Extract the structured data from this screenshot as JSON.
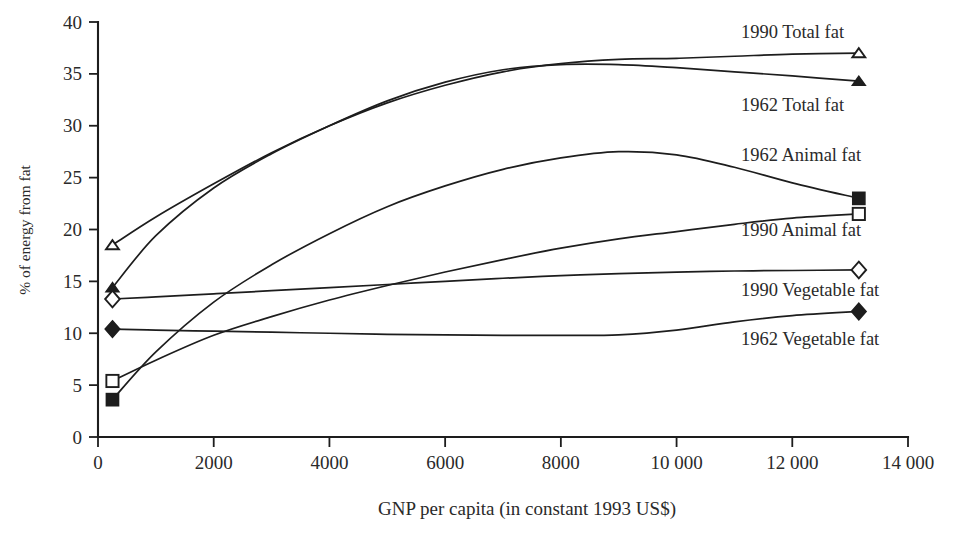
{
  "chart_data": {
    "type": "line",
    "title": "",
    "xlabel": "GNP per capita (in constant 1993 US$)",
    "ylabel": "% of energy from fat",
    "xlim": [
      0,
      14000
    ],
    "ylim": [
      0,
      40
    ],
    "xticks": [
      0,
      2000,
      4000,
      6000,
      8000,
      10000,
      12000,
      14000
    ],
    "xticklabels": [
      "0",
      "2000",
      "4000",
      "6000",
      "8000",
      "10 000",
      "12 000",
      "14 000"
    ],
    "yticks": [
      0,
      5,
      10,
      15,
      20,
      25,
      30,
      35,
      40
    ],
    "yticklabels": [
      "0",
      "5",
      "10",
      "15",
      "20",
      "25",
      "30",
      "35",
      "40"
    ],
    "grid": false,
    "legend_position": "inline-right-of-curves",
    "series": [
      {
        "name": "1990 Total fat",
        "marker": "open-triangle",
        "label_x": 14050,
        "label_y": 39.0,
        "x": [
          250,
          1000,
          2000,
          3000,
          4000,
          5000,
          6000,
          7000,
          8000,
          9000,
          10000,
          11000,
          12000,
          13150
        ],
        "y": [
          18.5,
          21.2,
          24.4,
          27.4,
          30.0,
          32.2,
          33.9,
          35.2,
          36.0,
          36.4,
          36.5,
          36.7,
          36.9,
          37.0
        ]
      },
      {
        "name": "1962 Total fat",
        "marker": "filled-triangle",
        "label_x": 14050,
        "label_y": 32.0,
        "x": [
          250,
          1000,
          2000,
          3000,
          4000,
          5000,
          6000,
          7000,
          8000,
          9000,
          10000,
          11000,
          12000,
          13150
        ],
        "y": [
          14.4,
          19.4,
          24.0,
          27.3,
          30.0,
          32.4,
          34.2,
          35.4,
          35.9,
          35.9,
          35.6,
          35.2,
          34.8,
          34.3
        ]
      },
      {
        "name": "1962 Animal fat",
        "marker": "filled-square",
        "label_x": 14050,
        "label_y": 27.2,
        "x": [
          250,
          1000,
          2000,
          3000,
          4000,
          5000,
          6000,
          7000,
          8000,
          9000,
          10000,
          11000,
          12000,
          13150
        ],
        "y": [
          3.6,
          8.2,
          13.0,
          16.6,
          19.6,
          22.2,
          24.2,
          25.8,
          26.9,
          27.5,
          27.2,
          26.0,
          24.5,
          23.0
        ]
      },
      {
        "name": "1990 Animal fat",
        "marker": "open-square",
        "label_x": 14050,
        "label_y": 20.0,
        "x": [
          250,
          1000,
          2000,
          3000,
          4000,
          5000,
          6000,
          7000,
          8000,
          9000,
          10000,
          11000,
          12000,
          13150
        ],
        "y": [
          5.4,
          7.4,
          9.8,
          11.6,
          13.2,
          14.6,
          15.9,
          17.1,
          18.2,
          19.1,
          19.8,
          20.5,
          21.1,
          21.5
        ]
      },
      {
        "name": "1990 Vegetable fat",
        "marker": "open-diamond",
        "label_x": 14050,
        "label_y": 14.2,
        "x": [
          250,
          1000,
          2000,
          3000,
          4000,
          5000,
          6000,
          7000,
          8000,
          9000,
          10000,
          11000,
          12000,
          13150
        ],
        "y": [
          13.3,
          13.5,
          13.8,
          14.1,
          14.4,
          14.7,
          15.0,
          15.3,
          15.55,
          15.75,
          15.9,
          16.0,
          16.05,
          16.1
        ]
      },
      {
        "name": "1962 Vegetable fat",
        "marker": "filled-diamond",
        "label_x": 14050,
        "label_y": 9.4,
        "x": [
          250,
          1000,
          2000,
          3000,
          4000,
          5000,
          6000,
          7000,
          8000,
          9000,
          10000,
          11000,
          12000,
          13150
        ],
        "y": [
          10.4,
          10.3,
          10.2,
          10.1,
          10.0,
          9.9,
          9.85,
          9.8,
          9.8,
          9.85,
          10.3,
          11.1,
          11.7,
          12.1
        ]
      }
    ]
  }
}
